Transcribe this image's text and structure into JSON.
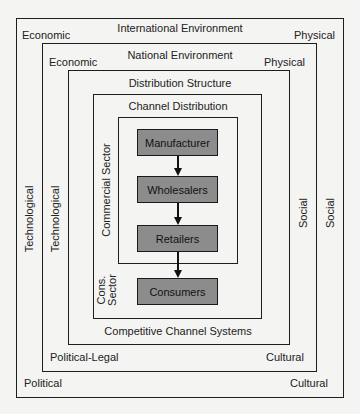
{
  "diagram": {
    "international": {
      "title": "International Environment",
      "top_left": "Economic",
      "top_right": "Physical",
      "left": "Technological",
      "right": "Social",
      "bottom_left": "Political",
      "bottom_right": "Cultural"
    },
    "national": {
      "title": "National Environment",
      "top_left": "Economic",
      "top_right": "Physical",
      "left": "Technological",
      "right": "Social",
      "bottom_left": "Political-Legal",
      "bottom_right": "Cultural"
    },
    "distribution_structure": {
      "title": "Distribution Structure",
      "bottom": "Competitive Channel Systems"
    },
    "channel_distribution": {
      "title": "Channel Distribution"
    },
    "sectors": {
      "commercial": "Commercial Sector",
      "consumer_line1": "Cons.",
      "consumer_line2": "Sector"
    },
    "nodes": [
      "Manufacturer",
      "Wholesalers",
      "Retailers",
      "Consumers"
    ],
    "colors": {
      "node_fill": "#8c8c8c",
      "border": "#1e1e1e",
      "background": "#f4f4f2"
    }
  }
}
